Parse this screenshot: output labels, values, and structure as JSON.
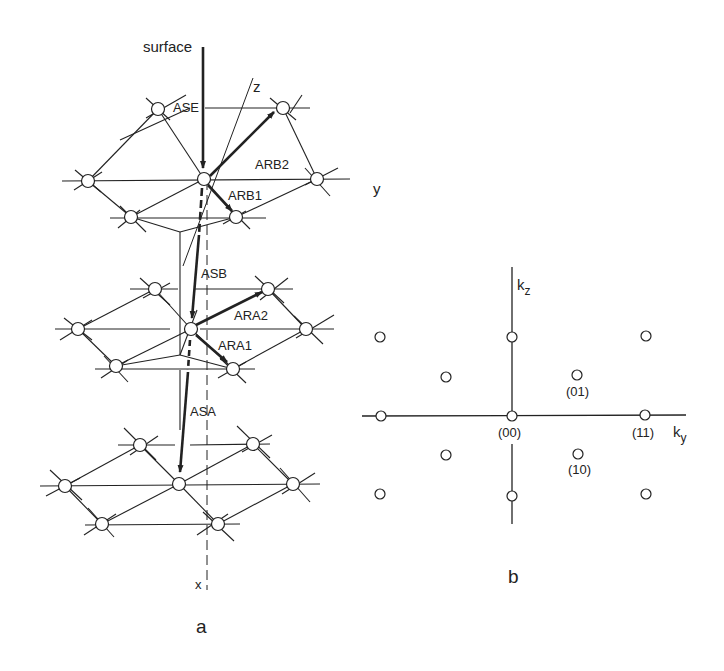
{
  "panel_a": {
    "caption": "a",
    "labels": {
      "surface": "surface",
      "z": "z",
      "y": "y",
      "x": "x",
      "ASE": "ASE",
      "ARB2": "ARB2",
      "ARB1": "ARB1",
      "ASB": "ASB",
      "ARA2": "ARA2",
      "ARA1": "ARA1",
      "ASA": "ASA"
    },
    "layers": [
      {
        "name": "top-layer",
        "center": [
          204,
          179
        ],
        "atoms": [
          [
            88,
            181
          ],
          [
            131,
            217
          ],
          [
            158,
            109
          ],
          [
            204,
            179
          ],
          [
            236,
            217
          ],
          [
            283,
            108
          ],
          [
            317,
            179
          ]
        ]
      },
      {
        "name": "middle-layer",
        "center": [
          191,
          329
        ],
        "atoms": [
          [
            78,
            329
          ],
          [
            116,
            366
          ],
          [
            155,
            289
          ],
          [
            191,
            329
          ],
          [
            233,
            369
          ],
          [
            268,
            289
          ],
          [
            306,
            329
          ]
        ]
      },
      {
        "name": "bottom-layer",
        "center": [
          179,
          484
        ],
        "atoms": [
          [
            65,
            486
          ],
          [
            102,
            524
          ],
          [
            140,
            445
          ],
          [
            179,
            484
          ],
          [
            218,
            524
          ],
          [
            253,
            444
          ],
          [
            293,
            484
          ]
        ]
      }
    ]
  },
  "panel_b": {
    "caption": "b",
    "axis_labels": {
      "kz": "k",
      "kz_sub": "z",
      "ky": "k",
      "ky_sub": "y"
    },
    "spot_labels": [
      {
        "text": "(00)",
        "x": 512,
        "y": 437
      },
      {
        "text": "(01)",
        "x": 578,
        "y": 393
      },
      {
        "text": "(11)",
        "x": 645,
        "y": 437
      },
      {
        "text": "(10)",
        "x": 579,
        "y": 470
      }
    ],
    "spots": [
      [
        380,
        337
      ],
      [
        512,
        337
      ],
      [
        646,
        336
      ],
      [
        446,
        377
      ],
      [
        577,
        375
      ],
      [
        380,
        416
      ],
      [
        512,
        416
      ],
      [
        646,
        415
      ],
      [
        446,
        455
      ],
      [
        578,
        455
      ],
      [
        380,
        494
      ],
      [
        512,
        496
      ],
      [
        646,
        494
      ]
    ]
  }
}
